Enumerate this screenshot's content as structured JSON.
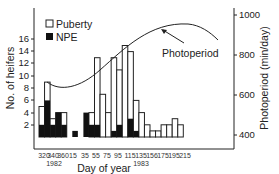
{
  "chart_data": {
    "type": "bar",
    "title": "",
    "xlabel": "Day of year",
    "ylabel": "No. of heifers",
    "y2label": "Photoperiod (min/day)",
    "ylim": [
      0,
      18
    ],
    "y2lim": [
      320,
      1020
    ],
    "yticks": [
      2,
      4,
      6,
      8,
      10,
      12,
      14,
      16
    ],
    "y2ticks": [
      400,
      600,
      800,
      1000
    ],
    "xtick_labels": [
      "320",
      "340",
      "360",
      "15",
      "35",
      "55",
      "75",
      "95",
      "115",
      "135",
      "156",
      "175",
      "195",
      "215"
    ],
    "year_labels": [
      {
        "label": "1982",
        "under": "340"
      },
      {
        "label": "1983",
        "under": "135"
      }
    ],
    "legend": [
      {
        "name": "Puberty",
        "style": "open"
      },
      {
        "name": "NPE",
        "style": "filled"
      }
    ],
    "legend_position": "upper-left",
    "grid": false,
    "annotations": [
      {
        "text": "Photoperiod",
        "arrow_to": "photoperiod-curve"
      }
    ],
    "bin_width_days": 10,
    "bins": [
      "320",
      "330",
      "340",
      "350",
      "360",
      "5",
      "15",
      "25",
      "35",
      "45",
      "55",
      "65",
      "75",
      "85",
      "95",
      "105",
      "115",
      "125",
      "135",
      "145",
      "155",
      "165",
      "175",
      "185",
      "195",
      "205",
      "215"
    ],
    "series": [
      {
        "name": "Puberty",
        "values": [
          5,
          9,
          3,
          4,
          4,
          0,
          0,
          0,
          0,
          4,
          13,
          7,
          4,
          13,
          11,
          15,
          14,
          6,
          4,
          2,
          1,
          1,
          2,
          2,
          3,
          2,
          0
        ]
      },
      {
        "name": "NPE",
        "values": [
          2,
          6,
          2,
          4,
          2,
          0,
          1,
          0,
          4,
          2,
          2,
          0,
          0,
          1,
          2,
          0,
          3,
          1,
          0,
          0,
          0,
          0,
          0,
          0,
          0,
          0,
          0
        ]
      },
      {
        "name": "Photoperiod",
        "type": "line",
        "x": [
          "340",
          "15",
          "55",
          "95",
          "135",
          "156",
          "175",
          "195",
          "215"
        ],
        "values": [
          580,
          560,
          650,
          790,
          910,
          940,
          920,
          860,
          790
        ]
      }
    ]
  },
  "labels": {
    "ylabel": "No. of heifers",
    "y2label": "Photoperiod (min/day)",
    "xlabel": "Day of year",
    "legend_puberty": "Puberty",
    "legend_npe": "NPE",
    "annotation": "Photoperiod",
    "year1": "1982",
    "year2": "1983",
    "yticks": [
      "16",
      "14",
      "12",
      "10",
      "8",
      "6",
      "4",
      "2"
    ],
    "y2ticks": [
      "1000",
      "800",
      "600",
      "400"
    ],
    "xticks": [
      "320",
      "340",
      "360",
      "15",
      "35",
      "55",
      "75",
      "95",
      "115",
      "135",
      "156",
      "175",
      "195",
      "215"
    ]
  }
}
